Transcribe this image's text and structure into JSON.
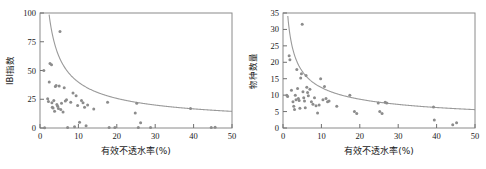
{
  "figure": {
    "background": "#ffffff",
    "marker_color": "#8c8c8c",
    "curve_color": "#9a9a9a",
    "axis_color": "#8a8a8a"
  },
  "chart_data": [
    {
      "type": "scatter",
      "panel": "left",
      "title": "",
      "xlabel": "有效不透水率(%)",
      "ylabel": "IBI指数",
      "xlim": [
        0,
        50
      ],
      "ylim": [
        0,
        100
      ],
      "xticks": [
        0,
        10,
        20,
        30,
        40,
        50
      ],
      "yticks": [
        0,
        25,
        50,
        75,
        100
      ],
      "xticklabels": [
        "0",
        "10",
        "20",
        "30",
        "40",
        "50"
      ],
      "yticklabels": [
        "0",
        "25",
        "50",
        "75",
        "100"
      ],
      "grid": false,
      "legend": null,
      "points": [
        [
          1.0,
          50.0
        ],
        [
          1.2,
          0.3
        ],
        [
          2.0,
          25.5
        ],
        [
          2.2,
          23.0
        ],
        [
          2.4,
          40.0
        ],
        [
          2.6,
          56.0
        ],
        [
          3.0,
          55.0
        ],
        [
          3.1,
          22.0
        ],
        [
          3.2,
          18.0
        ],
        [
          3.4,
          17.5
        ],
        [
          3.6,
          24.0
        ],
        [
          3.8,
          14.5
        ],
        [
          4.0,
          36.0
        ],
        [
          4.2,
          37.0
        ],
        [
          4.4,
          20.5
        ],
        [
          4.6,
          19.0
        ],
        [
          4.8,
          17.0
        ],
        [
          5.0,
          36.5
        ],
        [
          5.2,
          84.0
        ],
        [
          5.4,
          16.0
        ],
        [
          5.6,
          21.5
        ],
        [
          6.0,
          14.0
        ],
        [
          6.3,
          35.0
        ],
        [
          6.6,
          23.5
        ],
        [
          6.9,
          24.5
        ],
        [
          7.2,
          0.4
        ],
        [
          8.0,
          22.5
        ],
        [
          8.6,
          30.5
        ],
        [
          9.0,
          1.0
        ],
        [
          9.4,
          28.0
        ],
        [
          9.8,
          19.5
        ],
        [
          10.3,
          5.0
        ],
        [
          10.8,
          24.0
        ],
        [
          11.2,
          22.0
        ],
        [
          11.6,
          18.0
        ],
        [
          12.0,
          2.0
        ],
        [
          12.4,
          20.0
        ],
        [
          14.0,
          16.5
        ],
        [
          17.6,
          22.5
        ],
        [
          18.0,
          0.5
        ],
        [
          19.5,
          0.4
        ],
        [
          24.8,
          13.0
        ],
        [
          25.2,
          21.5
        ],
        [
          25.6,
          0.4
        ],
        [
          26.2,
          4.5
        ],
        [
          28.8,
          0.4
        ],
        [
          39.2,
          17.0
        ],
        [
          44.6,
          0.5
        ],
        [
          45.6,
          0.6
        ]
      ],
      "fit_curve": {
        "form": "power",
        "description": "decreasing power-law trend line",
        "a": 170,
        "b": -0.63
      }
    },
    {
      "type": "scatter",
      "panel": "right",
      "title": "",
      "xlabel": "有效不透水率(%)",
      "ylabel": "物种数量",
      "xlim": [
        0,
        50
      ],
      "ylim": [
        0,
        35
      ],
      "xticks": [
        0,
        10,
        20,
        30,
        40,
        50
      ],
      "yticks": [
        0,
        5,
        10,
        15,
        20,
        25,
        30,
        35
      ],
      "xticklabels": [
        "0",
        "10",
        "20",
        "30",
        "40",
        "50"
      ],
      "yticklabels": [
        "0",
        "5",
        "10",
        "15",
        "20",
        "25",
        "30",
        "35"
      ],
      "grid": false,
      "legend": null,
      "points": [
        [
          1.0,
          10.0
        ],
        [
          1.2,
          9.6
        ],
        [
          1.6,
          22.0
        ],
        [
          1.8,
          20.8
        ],
        [
          2.2,
          11.5
        ],
        [
          2.6,
          8.0
        ],
        [
          2.8,
          6.6
        ],
        [
          3.0,
          5.6
        ],
        [
          3.2,
          10.0
        ],
        [
          3.4,
          8.6
        ],
        [
          3.6,
          17.8
        ],
        [
          3.8,
          12.0
        ],
        [
          4.0,
          9.0
        ],
        [
          4.2,
          8.4
        ],
        [
          4.4,
          6.0
        ],
        [
          4.6,
          15.2
        ],
        [
          4.8,
          16.5
        ],
        [
          5.0,
          31.6
        ],
        [
          5.2,
          11.0
        ],
        [
          5.4,
          9.2
        ],
        [
          5.6,
          8.2
        ],
        [
          5.8,
          6.2
        ],
        [
          6.0,
          16.0
        ],
        [
          6.2,
          12.4
        ],
        [
          6.4,
          10.8
        ],
        [
          6.6,
          9.8
        ],
        [
          7.0,
          11.8
        ],
        [
          7.4,
          8.0
        ],
        [
          7.8,
          7.2
        ],
        [
          8.2,
          9.2
        ],
        [
          8.6,
          6.8
        ],
        [
          9.0,
          4.6
        ],
        [
          9.4,
          7.0
        ],
        [
          9.8,
          15.0
        ],
        [
          10.4,
          8.6
        ],
        [
          10.8,
          12.6
        ],
        [
          11.2,
          9.0
        ],
        [
          11.6,
          8.0
        ],
        [
          12.0,
          8.2
        ],
        [
          14.0,
          6.6
        ],
        [
          17.4,
          10.0
        ],
        [
          18.6,
          5.0
        ],
        [
          19.2,
          4.4
        ],
        [
          24.8,
          7.6
        ],
        [
          25.2,
          5.0
        ],
        [
          25.8,
          4.4
        ],
        [
          26.6,
          7.8
        ],
        [
          27.0,
          7.6
        ],
        [
          39.2,
          6.4
        ],
        [
          39.4,
          2.4
        ],
        [
          44.2,
          1.0
        ],
        [
          45.2,
          1.6
        ]
      ],
      "fit_curve": {
        "form": "power",
        "description": "decreasing power-law trend line",
        "a": 38,
        "b": -0.49
      }
    }
  ]
}
